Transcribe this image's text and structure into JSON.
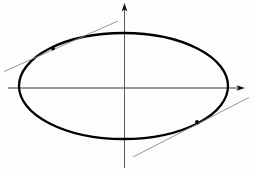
{
  "figure": {
    "canvas": {
      "width": 255,
      "height": 171,
      "background": "#fdfdfd"
    },
    "colors": {
      "curve": "#000000",
      "axis": "#3a3a3a",
      "tangent": "#8a8a8a",
      "tangent_point": "#000000"
    }
  },
  "chart_data": {
    "type": "scatter",
    "title": "",
    "xlabel": "",
    "ylabel": "",
    "grid": false,
    "legend": "none",
    "origin": {
      "x": 124.5,
      "y": 88
    },
    "axes": [
      {
        "name": "x-axis",
        "orientation": "horizontal",
        "x1": 8,
        "y1": 88,
        "x2": 245,
        "y2": 88,
        "arrow_end": "right",
        "color": "#3a3a3a",
        "width": 1
      },
      {
        "name": "y-axis",
        "orientation": "vertical",
        "x1": 124.5,
        "y1": 168,
        "x2": 124.5,
        "y2": 3,
        "arrow_end": "top",
        "color": "#3a3a3a",
        "width": 1
      }
    ],
    "curves": [
      {
        "name": "ellipse",
        "type": "ellipse",
        "cx": 123.5,
        "cy": 86,
        "rx": 104.5,
        "ry": 53,
        "stroke": "#000000",
        "stroke_width": 2.3,
        "fill": "none"
      }
    ],
    "tangent_lines": [
      {
        "name": "upper-left-tangent",
        "x1": 4,
        "y1": 71.5,
        "x2": 118,
        "y2": 21,
        "slope": -0.443,
        "stroke": "#8a8a8a",
        "stroke_width": 0.9,
        "tangent_point": {
          "x": 53,
          "y": 48.5
        }
      },
      {
        "name": "lower-right-tangent",
        "x1": 133,
        "y1": 157,
        "x2": 249,
        "y2": 97.5,
        "slope": -0.513,
        "stroke": "#8a8a8a",
        "stroke_width": 0.9,
        "tangent_point": {
          "x": 197,
          "y": 122
        }
      }
    ],
    "points": [
      {
        "name": "tangency-upper-left",
        "x": 53,
        "y": 48.5,
        "r": 1.9
      },
      {
        "name": "tangency-lower-right",
        "x": 197,
        "y": 122,
        "r": 1.9
      }
    ]
  }
}
